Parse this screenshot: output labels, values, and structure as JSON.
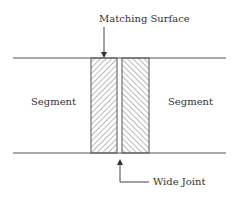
{
  "diagram": {
    "labels": {
      "matching_surface": "Matching Surface",
      "segment_left": "Segment",
      "segment_right": "Segment",
      "wide_joint": "Wide Joint"
    },
    "colors": {
      "line": "#555555",
      "hatch": "#666666",
      "text": "#333333",
      "background": "#ffffff"
    },
    "geometry": {
      "top_line": {
        "x1": 13,
        "x2": 226,
        "y": 58
      },
      "bottom_line": {
        "x1": 13,
        "x2": 226,
        "y": 153
      },
      "left_block": {
        "x": 91,
        "y": 58,
        "w": 26,
        "h": 95,
        "hatch": "forward-slash"
      },
      "right_block": {
        "x": 122,
        "y": 58,
        "w": 27,
        "h": 95,
        "hatch": "back-slash"
      },
      "top_arrow": {
        "x": 104,
        "y1": 27,
        "y2": 58
      },
      "bottom_arrow": {
        "x": 120,
        "y_tip": 159,
        "y_bend": 182,
        "x_end": 149
      }
    }
  }
}
